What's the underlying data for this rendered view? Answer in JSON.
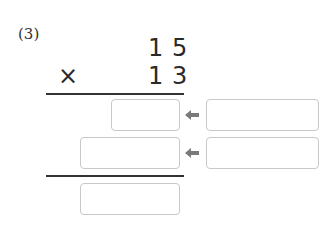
{
  "problem": {
    "number_label": "(3)",
    "multiplicand": {
      "tens": "1",
      "ones": "5"
    },
    "multiplier": {
      "tens": "1",
      "ones": "3"
    },
    "operator": "×"
  },
  "answer_boxes": {
    "partial_product_1": "",
    "partial_product_2": "",
    "final_product": "",
    "helper_1": "",
    "helper_2": ""
  },
  "colors": {
    "arrow": "#7a7a7a",
    "box_border": "#c8c8c8",
    "rule": "#333333"
  }
}
